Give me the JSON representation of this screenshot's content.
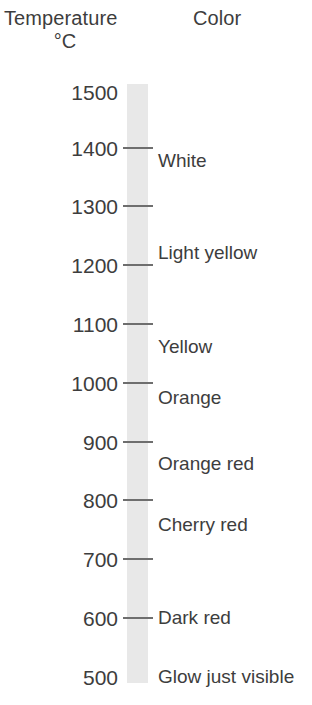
{
  "headers": {
    "temperature": "Temperature",
    "unit": "°C",
    "color": "Color"
  },
  "chart_data": {
    "type": "table",
    "title": "Temperature °C",
    "xlabel": "",
    "ylabel": "Temperature °C",
    "axis": {
      "orientation": "vertical",
      "direction": "descending",
      "min": 500,
      "max": 1500,
      "tick_step": 100,
      "grid": false
    },
    "columns": [
      "Temperature °C",
      "Color"
    ],
    "tick_labels": [
      "1500",
      "1400",
      "1300",
      "1200",
      "1100",
      "1000",
      "900",
      "800",
      "700",
      "600",
      "500"
    ],
    "tick_values": [
      1500,
      1400,
      1300,
      1200,
      1100,
      1000,
      900,
      800,
      700,
      600,
      500
    ],
    "tick_marks_drawn": [
      1400,
      1300,
      1200,
      1100,
      1000,
      900,
      800,
      700,
      600
    ],
    "legend_position": "none",
    "annotations": [
      {
        "label": "White",
        "temperature": 1380
      },
      {
        "label": "Light yellow",
        "temperature": 1225
      },
      {
        "label": "Yellow",
        "temperature": 1065
      },
      {
        "label": "Orange",
        "temperature": 978
      },
      {
        "label": "Orange red",
        "temperature": 865
      },
      {
        "label": "Cherry red",
        "temperature": 760
      },
      {
        "label": "Dark red",
        "temperature": 600
      },
      {
        "label": "Glow just visible",
        "temperature": 500
      }
    ],
    "series": [
      {
        "name": "Color",
        "values": [
          "White",
          "Light yellow",
          "Yellow",
          "Orange",
          "Orange red",
          "Cherry red",
          "Dark red",
          "Glow just visible"
        ]
      }
    ]
  },
  "scale": {
    "ticks": [
      {
        "label": "1500",
        "y": 82,
        "mark": false
      },
      {
        "label": "1400",
        "y": 138,
        "mark": true,
        "mark_y": 147
      },
      {
        "label": "1300",
        "y": 196,
        "mark": true,
        "mark_y": 205
      },
      {
        "label": "1200",
        "y": 255,
        "mark": true,
        "mark_y": 264
      },
      {
        "label": "1100",
        "y": 314,
        "mark": true,
        "mark_y": 323
      },
      {
        "label": "1000",
        "y": 373,
        "mark": true,
        "mark_y": 382
      },
      {
        "label": "900",
        "y": 432,
        "mark": true,
        "mark_y": 441
      },
      {
        "label": "800",
        "y": 490,
        "mark": true,
        "mark_y": 499
      },
      {
        "label": "700",
        "y": 549,
        "mark": true,
        "mark_y": 558
      },
      {
        "label": "600",
        "y": 608,
        "mark": true,
        "mark_y": 617
      },
      {
        "label": "500",
        "y": 667,
        "mark": false
      }
    ],
    "colors": [
      {
        "label": "White",
        "y": 151
      },
      {
        "label": "Light yellow",
        "y": 243
      },
      {
        "label": "Yellow",
        "y": 337
      },
      {
        "label": "Orange",
        "y": 388
      },
      {
        "label": "Orange red",
        "y": 454
      },
      {
        "label": "Cherry red",
        "y": 515
      },
      {
        "label": "Dark red",
        "y": 608
      },
      {
        "label": "Glow just visible",
        "y": 667
      }
    ]
  },
  "style": {
    "bar_color": "#e8e8e8",
    "text_color": "#3d3d3d",
    "tick_color": "#6e6e6e",
    "background": "#ffffff"
  }
}
